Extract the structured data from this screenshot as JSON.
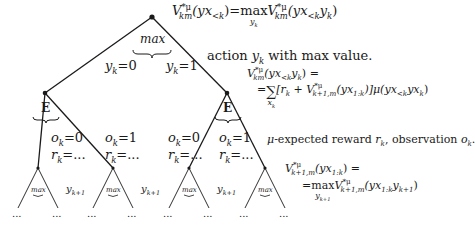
{
  "diagram": {
    "type": "expectimax-tree",
    "root": {
      "operator": "max",
      "formula": {
        "lhs": "V",
        "lhs_sup": "*μ",
        "lhs_sub": "km",
        "lhs_arg": "(yx",
        "lhs_arg_sub": "<k",
        "lhs_arg_close": ")",
        "eq": "=",
        "op": "max",
        "op_sub": "y",
        "op_sub_sub": "k",
        "rhs": "V",
        "rhs_sup": "*μ",
        "rhs_sub": "km",
        "rhs_arg": "(yx",
        "rhs_arg_sub": "<k",
        "rhs_arg_y": "y",
        "rhs_arg_y_sub": "k",
        "rhs_arg_close": ")"
      },
      "annotation": "action y_k with max value.",
      "annotation_parts": {
        "pre": "action ",
        "var": "y",
        "var_sub": "k",
        "post": " with max value."
      }
    },
    "action_edges": [
      {
        "var": "y",
        "sub": "k",
        "value": "=0"
      },
      {
        "var": "y",
        "sub": "k",
        "value": "=1"
      }
    ],
    "chance_nodes": [
      {
        "operator": "E"
      },
      {
        "operator": "E"
      }
    ],
    "chance_formula": {
      "line1_lhs": "V",
      "line1_sup": "*μ",
      "line1_sub": "km",
      "line1_arg": "(yx",
      "line1_arg_sub": "<k",
      "line1_arg_y": "y",
      "line1_arg_y_sub": "k",
      "line1_tail": ") =",
      "line2_eq": "=",
      "line2_sum": "∑",
      "line2_sum_sub": "x",
      "line2_sum_sub_sub": "k",
      "line2_body": "[r",
      "line2_r_sub": "k",
      "line2_plus": " + V",
      "line2_v_sup": "*μ",
      "line2_v_sub": "k+1,m",
      "line2_v_arg": "(yx",
      "line2_v_arg_sub": "1:k",
      "line2_mu": ")]μ(yx",
      "line2_mu_sub": "<k",
      "line2_mu_tail": "yx",
      "line2_mu_tail_sub": "k",
      "line2_close": ")"
    },
    "chance_annotation_parts": {
      "mu": "μ",
      "pre": "-expected reward ",
      "r": "r",
      "r_sub": "k",
      "mid": ", observation ",
      "o": "o",
      "o_sub": "k",
      "post": "."
    },
    "observation_edges": [
      {
        "o": "o",
        "o_sub": "k",
        "o_val": "=0",
        "r": "r",
        "r_sub": "k",
        "r_val": "=..."
      },
      {
        "o": "o",
        "o_sub": "k",
        "o_val": "=1",
        "r": "r",
        "r_sub": "k",
        "r_val": "=..."
      },
      {
        "o": "o",
        "o_sub": "k",
        "o_val": "=0",
        "r": "r",
        "r_sub": "k",
        "r_val": "=..."
      },
      {
        "o": "o",
        "o_sub": "k",
        "o_val": "=1",
        "r": "r",
        "r_sub": "k",
        "r_val": "=..."
      }
    ],
    "leaf_nodes": [
      {
        "operator": "max"
      },
      {
        "operator": "max"
      },
      {
        "operator": "max"
      },
      {
        "operator": "max"
      }
    ],
    "leaf_edge_label": {
      "var": "y",
      "sub": "k+1"
    },
    "ellipsis": "...",
    "leaf_formula": {
      "line1_lhs": "V",
      "line1_sup": "*μ",
      "line1_sub": "k+1,m",
      "line1_arg": "(yx",
      "line1_arg_sub": "1:k",
      "line1_tail": ") =",
      "line2_eq": "=",
      "line2_op": "max",
      "line2_op_sub": "y",
      "line2_op_sub_sub": "k+1",
      "line2_v": "V",
      "line2_v_sup": "*μ",
      "line2_v_sub": "k+1,m",
      "line2_arg": "(yx",
      "line2_arg_sub": "1:k",
      "line2_arg_y": "y",
      "line2_arg_y_sub": "k+1",
      "line2_close": ")"
    },
    "colors": {
      "line": "#1a1a1a",
      "background": "#ffffff"
    }
  }
}
